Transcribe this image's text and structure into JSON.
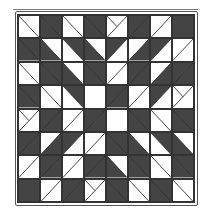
{
  "quilt": {
    "description": "8x8 half-square-triangle quilt block pattern",
    "colors": {
      "dark": "#444444",
      "light": "#ffffff",
      "line": "#222222"
    },
    "rows": 8,
    "cols": 8,
    "cells": [
      [
        [
          "\\",
          "w",
          "w"
        ],
        [
          "\\",
          "d",
          "d"
        ],
        [
          "\\",
          "w",
          "w"
        ],
        [
          "\\",
          "d",
          "d"
        ],
        [
          "x",
          "w",
          "w"
        ],
        [
          "/",
          "d",
          "d"
        ],
        [
          "/",
          "w",
          "w"
        ],
        [
          "-",
          "d",
          "d"
        ]
      ],
      [
        [
          "\\",
          "d",
          "d"
        ],
        [
          "\\",
          "w",
          "d"
        ],
        [
          "\\",
          "d",
          "w"
        ],
        [
          "\\",
          "w",
          "d"
        ],
        [
          "/",
          "d",
          "w"
        ],
        [
          "/",
          "w",
          "d"
        ],
        [
          "/",
          "d",
          "w"
        ],
        [
          "/",
          "w",
          "w"
        ]
      ],
      [
        [
          "\\",
          "w",
          "w"
        ],
        [
          "\\",
          "d",
          "d"
        ],
        [
          "\\",
          "w",
          "d"
        ],
        [
          "\\",
          "d",
          "d"
        ],
        [
          "/",
          "w",
          "w"
        ],
        [
          "/",
          "d",
          "d"
        ],
        [
          "/",
          "w",
          "d"
        ],
        [
          "/",
          "d",
          "d"
        ]
      ],
      [
        [
          "\\",
          "d",
          "d"
        ],
        [
          "\\",
          "w",
          "w"
        ],
        [
          "\\",
          "d",
          "w"
        ],
        [
          "-",
          "w",
          "w"
        ],
        [
          "/",
          "d",
          "d"
        ],
        [
          "/",
          "w",
          "w"
        ],
        [
          "/",
          "d",
          "w"
        ],
        [
          "x",
          "w",
          "w"
        ]
      ],
      [
        [
          "x",
          "w",
          "w"
        ],
        [
          "/",
          "d",
          "d"
        ],
        [
          "/",
          "w",
          "w"
        ],
        [
          "/",
          "d",
          "d"
        ],
        [
          "-",
          "w",
          "w"
        ],
        [
          "\\",
          "d",
          "d"
        ],
        [
          "\\",
          "w",
          "w"
        ],
        [
          "\\",
          "d",
          "d"
        ]
      ],
      [
        [
          "/",
          "d",
          "d"
        ],
        [
          "/",
          "w",
          "d"
        ],
        [
          "/",
          "d",
          "w"
        ],
        [
          "/",
          "w",
          "w"
        ],
        [
          "\\",
          "d",
          "d"
        ],
        [
          "\\",
          "w",
          "d"
        ],
        [
          "\\",
          "d",
          "w"
        ],
        [
          "\\",
          "w",
          "d"
        ]
      ],
      [
        [
          "/",
          "w",
          "w"
        ],
        [
          "/",
          "d",
          "d"
        ],
        [
          "/",
          "w",
          "w"
        ],
        [
          "/",
          "d",
          "d"
        ],
        [
          "\\",
          "w",
          "d"
        ],
        [
          "\\",
          "d",
          "d"
        ],
        [
          "\\",
          "w",
          "w"
        ],
        [
          "\\",
          "d",
          "d"
        ]
      ],
      [
        [
          "-",
          "d",
          "d"
        ],
        [
          "/",
          "w",
          "w"
        ],
        [
          "/",
          "d",
          "d"
        ],
        [
          "x",
          "w",
          "w"
        ],
        [
          "\\",
          "d",
          "d"
        ],
        [
          "\\",
          "w",
          "w"
        ],
        [
          "\\",
          "d",
          "d"
        ],
        [
          "\\",
          "w",
          "w"
        ]
      ]
    ]
  }
}
